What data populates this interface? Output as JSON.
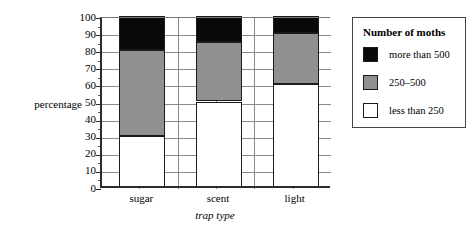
{
  "axes": {
    "ylabel": "percentage",
    "xlabel": "trap type",
    "yticks": [
      "100",
      "90",
      "80",
      "70",
      "60",
      "50",
      "40",
      "30",
      "20",
      "10",
      "0"
    ]
  },
  "legend": {
    "title": "Number of moths",
    "items": [
      {
        "label": "more than 500",
        "color": "#0a0a0a",
        "swatch": "black"
      },
      {
        "label": "250–500",
        "color": "#909090",
        "swatch": "gray"
      },
      {
        "label": "less than 250",
        "color": "#ffffff",
        "swatch": "white"
      }
    ]
  },
  "chart_data": {
    "type": "bar",
    "stacked": true,
    "title": "",
    "xlabel": "trap type",
    "ylabel": "percentage",
    "ylim": [
      0,
      100
    ],
    "ytick_step": 10,
    "grid": true,
    "legend_position": "right",
    "legend_title": "Number of moths",
    "categories": [
      "sugar",
      "scent",
      "light"
    ],
    "series": [
      {
        "name": "less than 250",
        "color": "#ffffff",
        "values": [
          30,
          50,
          60
        ]
      },
      {
        "name": "250–500",
        "color": "#909090",
        "values": [
          50,
          35,
          30
        ]
      },
      {
        "name": "more than 500",
        "color": "#0a0a0a",
        "values": [
          20,
          15,
          10
        ]
      }
    ],
    "cumulative_tops": {
      "sugar": {
        "less than 250": 30,
        "250–500": 80,
        "more than 500": 100
      },
      "scent": {
        "less than 250": 50,
        "250–500": 85,
        "more than 500": 100
      },
      "light": {
        "less than 250": 60,
        "250–500": 90,
        "more than 500": 100
      }
    }
  }
}
